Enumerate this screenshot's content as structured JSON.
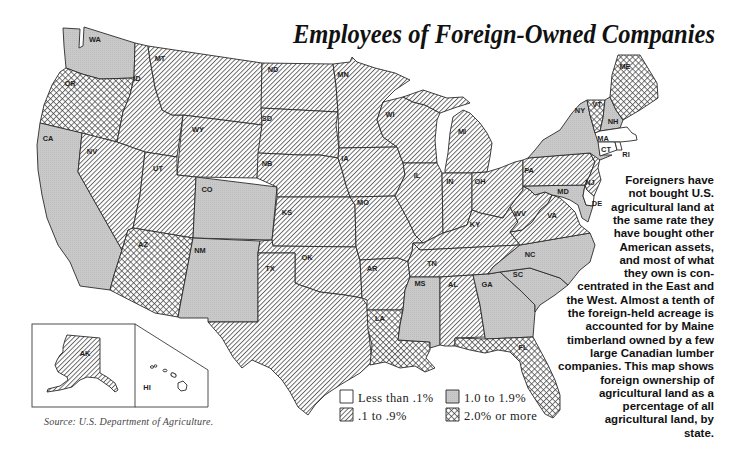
{
  "title": "Employees of Foreign-Owned Companies",
  "caption": {
    "lines": [
      "Foreigners have",
      "not bought U.S.",
      "agricultural land at",
      "the same rate they",
      "have bought other",
      "American assets,",
      "and most of what",
      "they own is con-",
      "centrated in the East and",
      "the West. Almost a tenth of",
      "the foreign-held acreage is",
      "accounted for by Maine",
      "timberland owned by a few",
      "large Canadian lumber",
      "companies. This map shows",
      "foreign ownership of",
      "agricultural land as a",
      "percentage of all",
      "agricultural land, by",
      "state."
    ]
  },
  "source": "Source: U.S. Department of Agriculture.",
  "legend": {
    "items": [
      {
        "label": "Less than .1%",
        "category": "lt0.1"
      },
      {
        "label": ".1 to .9%",
        "category": "0.1-0.9"
      },
      {
        "label": "1.0 to 1.9%",
        "category": "1.0-1.9"
      },
      {
        "label": "2.0% or more",
        "category": "2.0+"
      }
    ]
  },
  "colors": {
    "gray_fill": "#c8c8c8",
    "line": "#2a2a2a",
    "hatch": "#3c3c3c"
  },
  "map": {
    "states": {
      "WA": {
        "label": "WA",
        "category": "1.0-1.9"
      },
      "OR": {
        "label": "OR",
        "category": "2.0+"
      },
      "CA": {
        "label": "CA",
        "category": "1.0-1.9"
      },
      "ID": {
        "label": "ID",
        "category": "0.1-0.9"
      },
      "NV": {
        "label": "NV",
        "category": "0.1-0.9"
      },
      "MT": {
        "label": "MT",
        "category": "0.1-0.9"
      },
      "WY": {
        "label": "WY",
        "category": "0.1-0.9"
      },
      "UT": {
        "label": "UT",
        "category": "0.1-0.9"
      },
      "AZ": {
        "label": "AZ",
        "category": "2.0+"
      },
      "CO": {
        "label": "CO",
        "category": "1.0-1.9"
      },
      "NM": {
        "label": "NM",
        "category": "1.0-1.9"
      },
      "ND": {
        "label": "ND",
        "category": "0.1-0.9"
      },
      "SD": {
        "label": "SD",
        "category": "0.1-0.9"
      },
      "NB": {
        "label": "NB",
        "category": "0.1-0.9"
      },
      "KS": {
        "label": "KS",
        "category": "0.1-0.9"
      },
      "OK": {
        "label": "OK",
        "category": "0.1-0.9"
      },
      "TX": {
        "label": "TX",
        "category": "0.1-0.9"
      },
      "MN": {
        "label": "MN",
        "category": "0.1-0.9"
      },
      "IA": {
        "label": "IA",
        "category": "0.1-0.9"
      },
      "MO": {
        "label": "MO",
        "category": "0.1-0.9"
      },
      "AR": {
        "label": "AR",
        "category": "0.1-0.9"
      },
      "LA": {
        "label": "LA",
        "category": "2.0+"
      },
      "WI": {
        "label": "WI",
        "category": "0.1-0.9"
      },
      "MI": {
        "label": "MI",
        "category": "0.1-0.9"
      },
      "IL": {
        "label": "IL",
        "category": "0.1-0.9"
      },
      "IN": {
        "label": "IN",
        "category": "0.1-0.9"
      },
      "OH": {
        "label": "OH",
        "category": "0.1-0.9"
      },
      "KY": {
        "label": "KY",
        "category": "0.1-0.9"
      },
      "TN": {
        "label": "TN",
        "category": "0.1-0.9"
      },
      "MS": {
        "label": "MS",
        "category": "1.0-1.9"
      },
      "AL": {
        "label": "AL",
        "category": "0.1-0.9"
      },
      "GA": {
        "label": "GA",
        "category": "1.0-1.9"
      },
      "FL": {
        "label": "FL",
        "category": "2.0+"
      },
      "SC": {
        "label": "SC",
        "category": "1.0-1.9"
      },
      "NC": {
        "label": "NC",
        "category": "1.0-1.9"
      },
      "VA": {
        "label": "VA",
        "category": "0.1-0.9"
      },
      "WV": {
        "label": "WV",
        "category": "0.1-0.9"
      },
      "PA": {
        "label": "PA",
        "category": "0.1-0.9"
      },
      "NY": {
        "label": "NY",
        "category": "1.0-1.9"
      },
      "NJ": {
        "label": "NJ",
        "category": "0.1-0.9"
      },
      "MD": {
        "label": "MD",
        "category": "1.0-1.9"
      },
      "DE": {
        "label": "DE",
        "category": "lt0.1"
      },
      "VT": {
        "label": "VT",
        "category": "2.0+"
      },
      "NH": {
        "label": "NH",
        "category": "1.0-1.9"
      },
      "ME": {
        "label": "ME",
        "category": "2.0+"
      },
      "MA": {
        "label": "MA",
        "category": "lt0.1"
      },
      "CT": {
        "label": "CT",
        "category": "lt0.1"
      },
      "RI": {
        "label": "RI",
        "category": "lt0.1"
      },
      "AK": {
        "label": "AK",
        "category": "0.1-0.9"
      },
      "HI": {
        "label": "HI",
        "category": "lt0.1"
      }
    }
  }
}
